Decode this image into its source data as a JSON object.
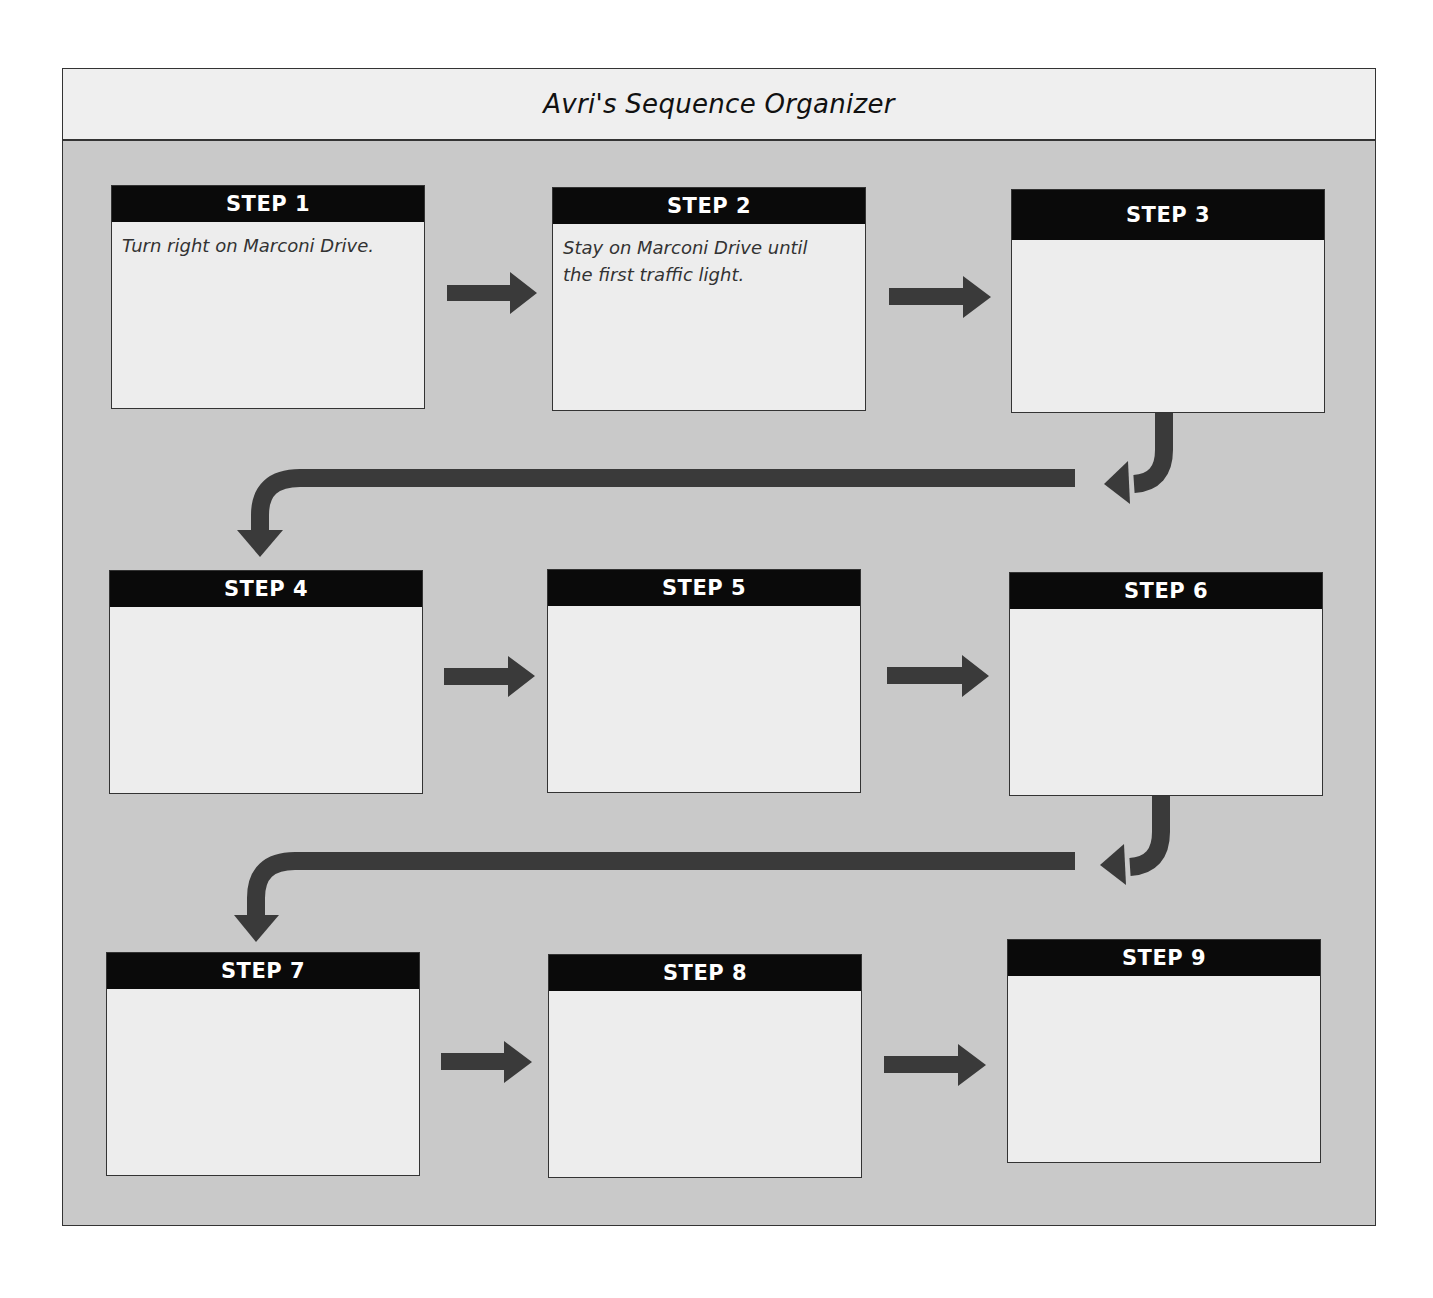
{
  "title": "Avri's Sequence Organizer",
  "colors": {
    "frame_bg": "#c9c9c9",
    "title_bg": "#efefef",
    "header_bg": "#0a0a0a",
    "box_bg": "#ededed",
    "arrow": "#3a3a3a"
  },
  "steps": [
    {
      "label": "STEP 1",
      "text": "Turn right on Marconi Drive."
    },
    {
      "label": "STEP 2",
      "text": "Stay on Marconi Drive until the first traffic light."
    },
    {
      "label": "STEP 3",
      "text": ""
    },
    {
      "label": "STEP 4",
      "text": ""
    },
    {
      "label": "STEP 5",
      "text": ""
    },
    {
      "label": "STEP 6",
      "text": ""
    },
    {
      "label": "STEP 7",
      "text": ""
    },
    {
      "label": "STEP 8",
      "text": ""
    },
    {
      "label": "STEP 9",
      "text": ""
    }
  ]
}
